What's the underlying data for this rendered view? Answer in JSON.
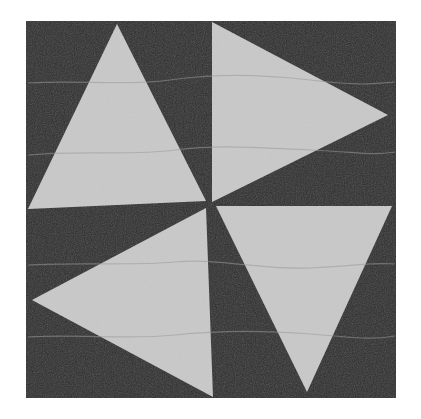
{
  "image": {
    "subject": "Pinwheel quilt block",
    "colors": {
      "background": "#ffffff",
      "dark_fabric": "#2f2f2f",
      "light_fabric": "#c9c9c9",
      "quilting_line": "#9a9a9a"
    },
    "block": {
      "x": 26,
      "y": 21,
      "width": 370,
      "height": 377
    },
    "triangles": [
      {
        "name": "top-left",
        "points": "117,24 28,209 206,201"
      },
      {
        "name": "top-right",
        "points": "212,22 388,115 212,202"
      },
      {
        "name": "bottom-right",
        "points": "216,206 392,206 307,392"
      },
      {
        "name": "bottom-left",
        "points": "32,300 206,208 213,397"
      }
    ]
  }
}
